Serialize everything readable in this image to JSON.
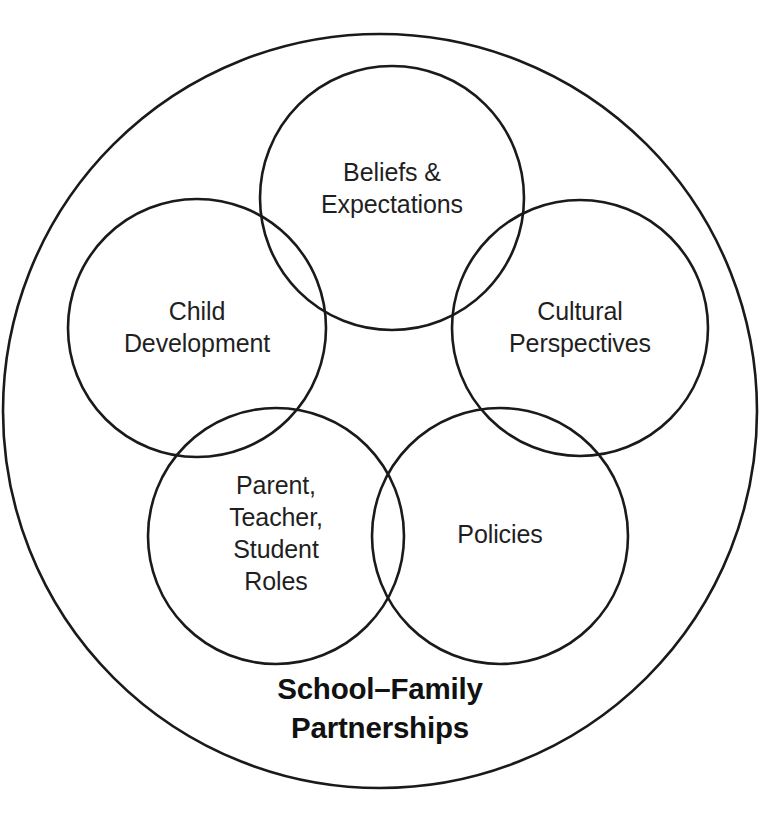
{
  "diagram": {
    "type": "venn-nested-circles",
    "background_color": "#ffffff",
    "stroke_color": "#1a1a1a",
    "text_color": "#1f1f1f",
    "caption_color": "#111111",
    "outer_circle": {
      "name": "School-Family Partnerships",
      "caption_line_1": "School–Family",
      "caption_line_2": "Partnerships",
      "center_x": 380,
      "center_y": 411,
      "radius": 377
    },
    "nodes": [
      {
        "id": "beliefs-expectations",
        "line_1": "Beliefs &",
        "line_2": "Expectations",
        "line_3": "",
        "line_4": "",
        "center_x": 392,
        "center_y": 198,
        "radius": 132,
        "label_center_x": 392,
        "label_center_y": 174
      },
      {
        "id": "child-development",
        "line_1": "Child",
        "line_2": "Development",
        "line_3": "",
        "line_4": "",
        "center_x": 197,
        "center_y": 328,
        "radius": 129,
        "label_center_x": 197,
        "label_center_y": 313
      },
      {
        "id": "cultural-perspectives",
        "line_1": "Cultural",
        "line_2": "Perspectives",
        "line_3": "",
        "line_4": "",
        "center_x": 580,
        "center_y": 328,
        "radius": 128,
        "label_center_x": 580,
        "label_center_y": 313
      },
      {
        "id": "parent-teacher-student-roles",
        "line_1": "Parent,",
        "line_2": "Teacher,",
        "line_3": "Student",
        "line_4": "Roles",
        "center_x": 276,
        "center_y": 536,
        "radius": 128,
        "label_center_x": 276,
        "label_center_y": 487
      },
      {
        "id": "policies",
        "line_1": "Policies",
        "line_2": "",
        "line_3": "",
        "line_4": "",
        "center_x": 500,
        "center_y": 536,
        "radius": 128,
        "label_center_x": 500,
        "label_center_y": 536
      }
    ],
    "caption": {
      "line_1_x": 380,
      "line_1_y": 691,
      "line_2_x": 380,
      "line_2_y": 730
    }
  },
  "page_bleed": {
    "clipped_header_text": ""
  }
}
